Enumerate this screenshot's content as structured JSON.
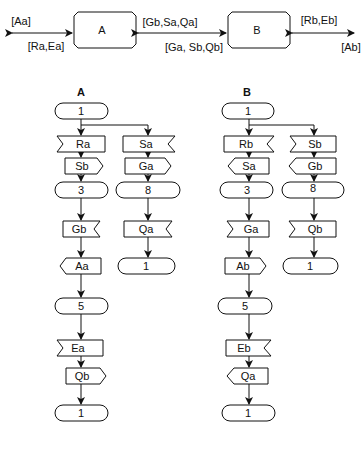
{
  "top": {
    "blocks": [
      {
        "label": "A"
      },
      {
        "label": "B"
      }
    ],
    "labels": {
      "left_out": "[Aa]",
      "left_in": "[Ra,Ea]",
      "mid_top": "[Gb,Sa,Qa]",
      "mid_bottom": "[Ga, Sb,Qb]",
      "right_in": "[Rb,Eb]",
      "right_out": "[Ab]"
    }
  },
  "A": {
    "title": "A",
    "main": [
      {
        "type": "state",
        "label": "1"
      },
      {
        "type": "receive",
        "label": "Ra"
      },
      {
        "type": "send",
        "label": "Sb"
      },
      {
        "type": "state",
        "label": "3"
      },
      {
        "type": "receive",
        "label": "Gb"
      },
      {
        "type": "send",
        "label": "Aa"
      },
      {
        "type": "state",
        "label": "5"
      },
      {
        "type": "receive",
        "label": "Ea"
      },
      {
        "type": "send",
        "label": "Qb"
      },
      {
        "type": "state",
        "label": "1"
      }
    ],
    "branch": [
      {
        "type": "receive",
        "label": "Sa"
      },
      {
        "type": "send",
        "label": "Ga"
      },
      {
        "type": "state",
        "label": "8"
      },
      {
        "type": "receive",
        "label": "Qa"
      },
      {
        "type": "state",
        "label": "1"
      }
    ]
  },
  "B": {
    "title": "B",
    "main": [
      {
        "type": "state",
        "label": "1"
      },
      {
        "type": "receive",
        "label": "Rb"
      },
      {
        "type": "send",
        "label": "Sa"
      },
      {
        "type": "state",
        "label": "3"
      },
      {
        "type": "receive",
        "label": "Ga"
      },
      {
        "type": "send",
        "label": "Ab"
      },
      {
        "type": "state",
        "label": "5"
      },
      {
        "type": "receive",
        "label": "Eb"
      },
      {
        "type": "send",
        "label": "Qa"
      },
      {
        "type": "state",
        "label": "1"
      }
    ],
    "branch": [
      {
        "type": "receive",
        "label": "Sb"
      },
      {
        "type": "send",
        "label": "Gb"
      },
      {
        "type": "state",
        "label": "8"
      },
      {
        "type": "receive",
        "label": "Qb"
      },
      {
        "type": "state",
        "label": "1"
      }
    ]
  }
}
